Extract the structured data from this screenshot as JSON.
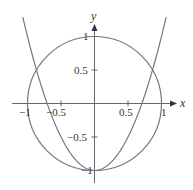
{
  "chart_data": {
    "type": "line",
    "title": "",
    "xlabel": "x",
    "ylabel": "y",
    "xlim": [
      -1.25,
      1.25
    ],
    "ylim": [
      -1.2,
      1.1
    ],
    "grid": false,
    "legend": null,
    "x_ticks": [
      -1,
      -0.5,
      0.5,
      1
    ],
    "x_tick_labels": [
      "−1",
      "−0.5",
      "0.5",
      "1"
    ],
    "y_ticks": [
      1,
      0.5,
      -0.5,
      -1
    ],
    "y_tick_labels": [
      "1",
      "0.5",
      "−0.5",
      "−1"
    ],
    "series": [
      {
        "name": "circle",
        "equation": "x^2 + y^2 = 1",
        "center": [
          0,
          0
        ],
        "radius": 1,
        "color": "#777777"
      },
      {
        "name": "parabola",
        "equation": "y = 2x^2 - 1",
        "x": [
          -1.07,
          -1.0,
          -0.866,
          -0.75,
          -0.5,
          -0.25,
          0,
          0.25,
          0.5,
          0.75,
          0.866,
          1.0,
          1.07
        ],
        "y": [
          1.29,
          1.0,
          0.5,
          0.125,
          -0.5,
          -0.875,
          -1.0,
          -0.875,
          -0.5,
          0.125,
          0.5,
          1.0,
          1.29
        ],
        "color": "#777777"
      }
    ],
    "intersections": [
      [
        -0.866,
        0.5
      ],
      [
        0.866,
        0.5
      ],
      [
        0,
        -1
      ]
    ]
  },
  "axes": {
    "x_label": "x",
    "y_label": "y"
  }
}
